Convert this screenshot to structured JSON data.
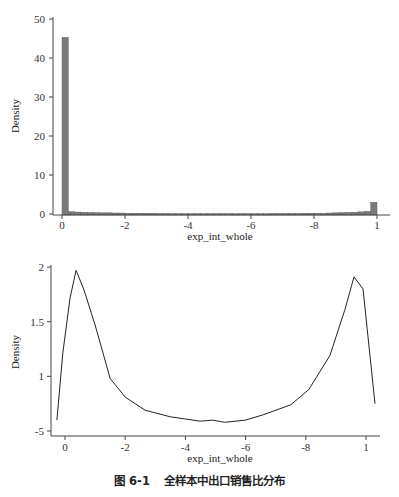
{
  "caption": {
    "figure_number": "图 6-1",
    "title": "全样本中出口销售比分布"
  },
  "chart_data": [
    {
      "type": "bar",
      "subtype": "histogram",
      "title": "",
      "xlabel": "exp_int_whole",
      "ylabel": "Density",
      "x_tick_labels": [
        "0",
        "-2",
        "-4",
        "-6",
        "-8",
        "1"
      ],
      "x_tick_values": [
        0,
        0.2,
        0.4,
        0.6,
        0.8,
        1.0
      ],
      "y_tick_labels": [
        "0",
        "10",
        "20",
        "30",
        "40",
        "50"
      ],
      "y_tick_values": [
        0,
        10,
        20,
        30,
        40,
        50
      ],
      "xlim": [
        -0.02,
        1.02
      ],
      "ylim": [
        0,
        52
      ],
      "grid": false,
      "bin_width": 0.02,
      "bins": [
        {
          "x0": 0.0,
          "density": 45.3
        },
        {
          "x0": 0.02,
          "density": 0.6
        },
        {
          "x0": 0.04,
          "density": 0.5
        },
        {
          "x0": 0.06,
          "density": 0.45
        },
        {
          "x0": 0.08,
          "density": 0.4
        },
        {
          "x0": 0.1,
          "density": 0.35
        },
        {
          "x0": 0.12,
          "density": 0.3
        },
        {
          "x0": 0.14,
          "density": 0.3
        },
        {
          "x0": 0.16,
          "density": 0.25
        },
        {
          "x0": 0.18,
          "density": 0.25
        },
        {
          "x0": 0.2,
          "density": 0.2
        },
        {
          "x0": 0.22,
          "density": 0.2
        },
        {
          "x0": 0.24,
          "density": 0.2
        },
        {
          "x0": 0.26,
          "density": 0.2
        },
        {
          "x0": 0.28,
          "density": 0.2
        },
        {
          "x0": 0.3,
          "density": 0.15
        },
        {
          "x0": 0.32,
          "density": 0.15
        },
        {
          "x0": 0.34,
          "density": 0.1
        },
        {
          "x0": 0.36,
          "density": 0.1
        },
        {
          "x0": 0.38,
          "density": 0.1
        },
        {
          "x0": 0.4,
          "density": 0.1
        },
        {
          "x0": 0.42,
          "density": 0.1
        },
        {
          "x0": 0.44,
          "density": 0.1
        },
        {
          "x0": 0.46,
          "density": 0.1
        },
        {
          "x0": 0.48,
          "density": 0.1
        },
        {
          "x0": 0.5,
          "density": 0.1
        },
        {
          "x0": 0.52,
          "density": 0.1
        },
        {
          "x0": 0.54,
          "density": 0.1
        },
        {
          "x0": 0.56,
          "density": 0.1
        },
        {
          "x0": 0.58,
          "density": 0.1
        },
        {
          "x0": 0.6,
          "density": 0.1
        },
        {
          "x0": 0.62,
          "density": 0.1
        },
        {
          "x0": 0.64,
          "density": 0.1
        },
        {
          "x0": 0.66,
          "density": 0.15
        },
        {
          "x0": 0.68,
          "density": 0.15
        },
        {
          "x0": 0.7,
          "density": 0.15
        },
        {
          "x0": 0.72,
          "density": 0.15
        },
        {
          "x0": 0.74,
          "density": 0.15
        },
        {
          "x0": 0.76,
          "density": 0.2
        },
        {
          "x0": 0.78,
          "density": 0.2
        },
        {
          "x0": 0.8,
          "density": 0.2
        },
        {
          "x0": 0.82,
          "density": 0.2
        },
        {
          "x0": 0.84,
          "density": 0.25
        },
        {
          "x0": 0.86,
          "density": 0.3
        },
        {
          "x0": 0.88,
          "density": 0.35
        },
        {
          "x0": 0.9,
          "density": 0.4
        },
        {
          "x0": 0.92,
          "density": 0.45
        },
        {
          "x0": 0.94,
          "density": 0.55
        },
        {
          "x0": 0.96,
          "density": 0.7
        },
        {
          "x0": 0.98,
          "density": 3.0
        }
      ],
      "bar_color": "#7a7a7a"
    },
    {
      "type": "line",
      "subtype": "kernel_density",
      "title": "",
      "xlabel": "exp_int_whole",
      "ylabel": "Density",
      "x_tick_labels": [
        "0",
        "-2",
        "-4",
        "-6",
        "-8",
        "1"
      ],
      "x_tick_values": [
        0,
        0.2,
        0.4,
        0.6,
        0.8,
        1.0
      ],
      "y_tick_labels": [
        "-5",
        "1",
        "1.5",
        "2"
      ],
      "y_tick_values": [
        0.5,
        1.0,
        1.5,
        2.0
      ],
      "xlim": [
        -0.04,
        1.04
      ],
      "ylim": [
        0.48,
        2.02
      ],
      "grid": false,
      "line_color": "#222222",
      "x": [
        -0.027,
        -0.007,
        0.017,
        0.037,
        0.063,
        0.1,
        0.15,
        0.2,
        0.266,
        0.35,
        0.45,
        0.49,
        0.53,
        0.6,
        0.66,
        0.75,
        0.81,
        0.88,
        0.93,
        0.96,
        0.99,
        1.03
      ],
      "y": [
        0.6,
        1.22,
        1.72,
        1.97,
        1.79,
        1.47,
        0.98,
        0.81,
        0.69,
        0.63,
        0.59,
        0.6,
        0.58,
        0.6,
        0.65,
        0.74,
        0.88,
        1.19,
        1.61,
        1.91,
        1.8,
        0.75
      ]
    }
  ]
}
